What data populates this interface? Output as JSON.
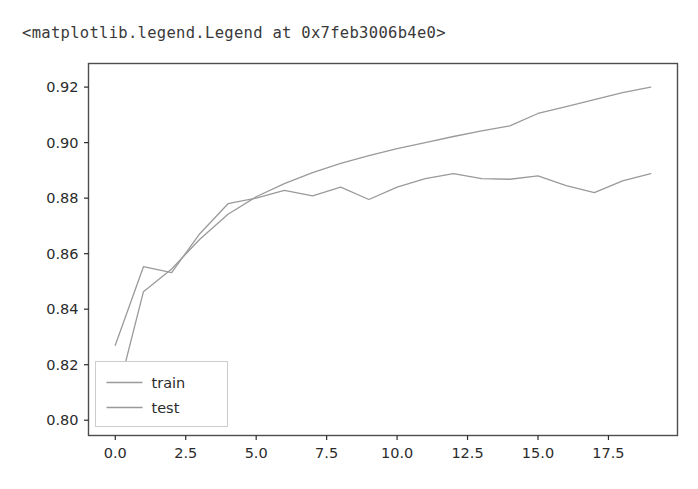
{
  "output": {
    "repr_text": "<matplotlib.legend.Legend at 0x7feb3006b4e0>"
  },
  "figure": {
    "background_color": "#ffffff",
    "axes_edge_color": "#4d4d4d",
    "tick_color": "#2b2b2b",
    "line_color": "#9a9a9a",
    "legend": {
      "position": "lower left",
      "frame_color": "#cccccc",
      "entries": [
        {
          "label": "train",
          "color": "#9a9a9a"
        },
        {
          "label": "test",
          "color": "#9a9a9a"
        }
      ]
    }
  },
  "chart_data": {
    "type": "line",
    "title": "",
    "xlabel": "",
    "ylabel": "",
    "xlim": [
      -0.95,
      19.95
    ],
    "ylim": [
      0.7945,
      0.9285
    ],
    "xticks": [
      0.0,
      2.5,
      5.0,
      7.5,
      10.0,
      12.5,
      15.0,
      17.5
    ],
    "xtick_labels": [
      "0.0",
      "2.5",
      "5.0",
      "7.5",
      "10.0",
      "12.5",
      "15.0",
      "17.5"
    ],
    "yticks": [
      0.8,
      0.82,
      0.84,
      0.86,
      0.88,
      0.9,
      0.92
    ],
    "ytick_labels": [
      "0.80",
      "0.82",
      "0.84",
      "0.86",
      "0.88",
      "0.90",
      "0.92"
    ],
    "grid": false,
    "legend_position": "lower left",
    "x": [
      0,
      1,
      2,
      3,
      4,
      5,
      6,
      7,
      8,
      9,
      10,
      11,
      12,
      13,
      14,
      15,
      16,
      17,
      18,
      19
    ],
    "series": [
      {
        "name": "train",
        "color": "#9a9a9a",
        "values": [
          0.8063,
          0.8463,
          0.8545,
          0.8652,
          0.8742,
          0.8805,
          0.8852,
          0.8892,
          0.8925,
          0.8953,
          0.8978,
          0.9,
          0.9022,
          0.9042,
          0.906,
          0.9105,
          0.913,
          0.9155,
          0.918,
          0.92
        ]
      },
      {
        "name": "test",
        "color": "#9a9a9a",
        "values": [
          0.827,
          0.8553,
          0.8532,
          0.8672,
          0.878,
          0.88,
          0.8828,
          0.8808,
          0.884,
          0.8795,
          0.884,
          0.887,
          0.8888,
          0.887,
          0.8868,
          0.888,
          0.8845,
          0.882,
          0.8862,
          0.8888
        ]
      }
    ]
  }
}
